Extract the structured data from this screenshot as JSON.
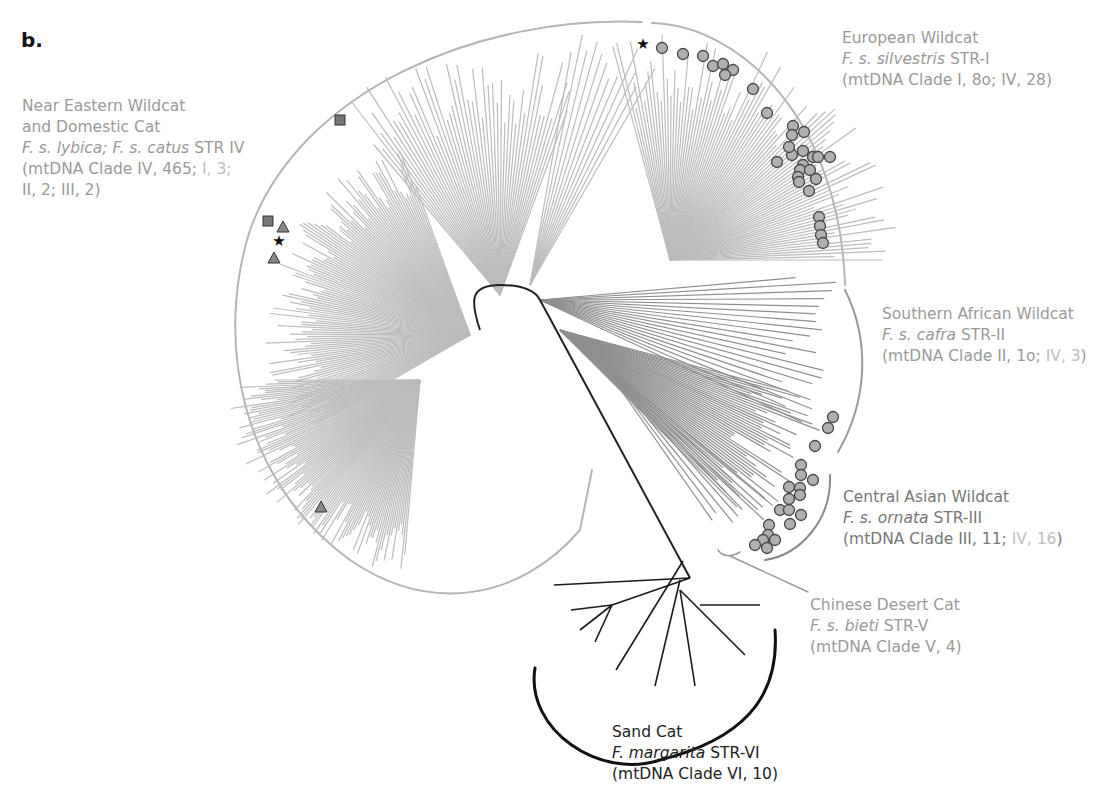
{
  "panel_letter": "b.",
  "colors": {
    "light_branch": "#b8b8b8",
    "mid_branch": "#8a8a8a",
    "dark_branch": "#1a1a1a",
    "label_gray": "#9a9a9a",
    "marker_fill": "#b0b0b0",
    "marker_dark": "#555555"
  },
  "clades": [
    {
      "id": "near-eastern",
      "common": "Near Eastern Wildcat",
      "common2": "and Domestic Cat",
      "species": "F. s. lybica; F. s. catus",
      "str": "STR IV",
      "mt_a": "(mtDNA Clade IV, 465;",
      "mt_b": "I, 3;",
      "mt_c": "II, 2; III, 2)"
    },
    {
      "id": "european",
      "common": "European Wildcat",
      "species": "F. s. silvestris",
      "str": "STR-I",
      "mt": "(mtDNA Clade I, 8o; IV, 28)"
    },
    {
      "id": "southern-african",
      "common": "Southern African Wildcat",
      "species": "F. s. cafra",
      "str": "STR-II",
      "mt_a": "(mtDNA Clade II, 1o;",
      "mt_b": "IV, 3",
      "mt_c": ")"
    },
    {
      "id": "central-asian",
      "common": "Central Asian Wildcat",
      "species": "F. s. ornata",
      "str": "STR-III",
      "mt_a": "(mtDNA Clade III, 11;",
      "mt_b": "IV, 16",
      "mt_c": ")"
    },
    {
      "id": "chinese-desert",
      "common": "Chinese Desert Cat",
      "species": "F. s. bieti",
      "str": "STR-V",
      "mt": "(mtDNA Clade V, 4)"
    },
    {
      "id": "sand-cat",
      "common": "Sand Cat",
      "species": "F. margarita",
      "str": "STR-VI",
      "mt": "(mtDNA Clade VI, 10)"
    }
  ],
  "legend_markers": {
    "circle": "circle-marker",
    "square": "square-marker",
    "triangle": "triangle-marker",
    "star": "star-marker"
  }
}
